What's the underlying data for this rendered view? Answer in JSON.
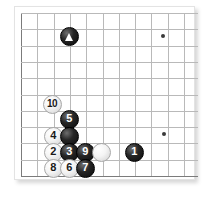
{
  "diagram": {
    "type": "go-board-diagram",
    "title": "",
    "board": {
      "visible_columns": 11,
      "visible_rows": 11,
      "origin_x": 21,
      "origin_y": 13,
      "cell": 16.3,
      "line_color": "#b9b9b9",
      "edge_color": "#7b7b7b",
      "background": "#ffffff"
    },
    "star_points": [
      {
        "name": "star-point-top-right",
        "col": 8.7,
        "row": 1.4
      },
      {
        "name": "star-point-bottom-right",
        "col": 8.8,
        "row": 7.4
      }
    ],
    "stones": [
      {
        "id": "stone-marked-triangle",
        "color": "black",
        "label": "",
        "marker": "triangle",
        "x": 69,
        "y": 36
      },
      {
        "id": "stone-10",
        "color": "white",
        "label": "10",
        "marker": "",
        "x": 52,
        "y": 104
      },
      {
        "id": "stone-5",
        "color": "black",
        "label": "5",
        "marker": "",
        "x": 69,
        "y": 119
      },
      {
        "id": "stone-4",
        "color": "white",
        "label": "4",
        "marker": "",
        "x": 53,
        "y": 136
      },
      {
        "id": "stone-black-unnumbered",
        "color": "black",
        "label": "",
        "marker": "",
        "x": 69,
        "y": 136
      },
      {
        "id": "stone-2",
        "color": "white",
        "label": "2",
        "marker": "",
        "x": 53,
        "y": 152
      },
      {
        "id": "stone-3",
        "color": "black",
        "label": "3",
        "marker": "",
        "x": 69,
        "y": 152
      },
      {
        "id": "stone-9",
        "color": "black",
        "label": "9",
        "marker": "",
        "x": 85,
        "y": 152
      },
      {
        "id": "stone-white-unnumbered",
        "color": "white",
        "label": "",
        "marker": "",
        "x": 101,
        "y": 152
      },
      {
        "id": "stone-1",
        "color": "black",
        "label": "1",
        "marker": "",
        "x": 134,
        "y": 152
      },
      {
        "id": "stone-8",
        "color": "white",
        "label": "8",
        "marker": "",
        "x": 53,
        "y": 168
      },
      {
        "id": "stone-6",
        "color": "white",
        "label": "6",
        "marker": "",
        "x": 69,
        "y": 168
      },
      {
        "id": "stone-7",
        "color": "black",
        "label": "7",
        "marker": "",
        "x": 85,
        "y": 168
      }
    ]
  }
}
